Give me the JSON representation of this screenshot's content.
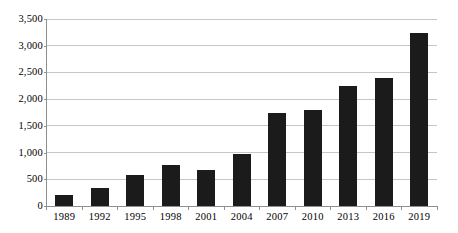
{
  "chart_data": {
    "type": "bar",
    "title": "",
    "xlabel": "",
    "ylabel": "",
    "categories": [
      "1989",
      "1992",
      "1995",
      "1998",
      "2001",
      "2004",
      "2007",
      "2010",
      "2013",
      "2016",
      "2019"
    ],
    "values": [
      200,
      345,
      575,
      775,
      675,
      965,
      1750,
      1800,
      2250,
      2390,
      3230
    ],
    "ylim": [
      0,
      3500
    ],
    "ytick_interval": 500,
    "ytick_labels": [
      "0",
      "500",
      "1,000",
      "1,500",
      "2,000",
      "2,500",
      "3,000",
      "3,500"
    ],
    "grid": true,
    "legend": false,
    "colors": {
      "bar": "#1b1b1b",
      "gridline": "#c6c6c6",
      "axis": "#8f8f8f",
      "text": "#000000",
      "background": "#ffffff"
    }
  }
}
